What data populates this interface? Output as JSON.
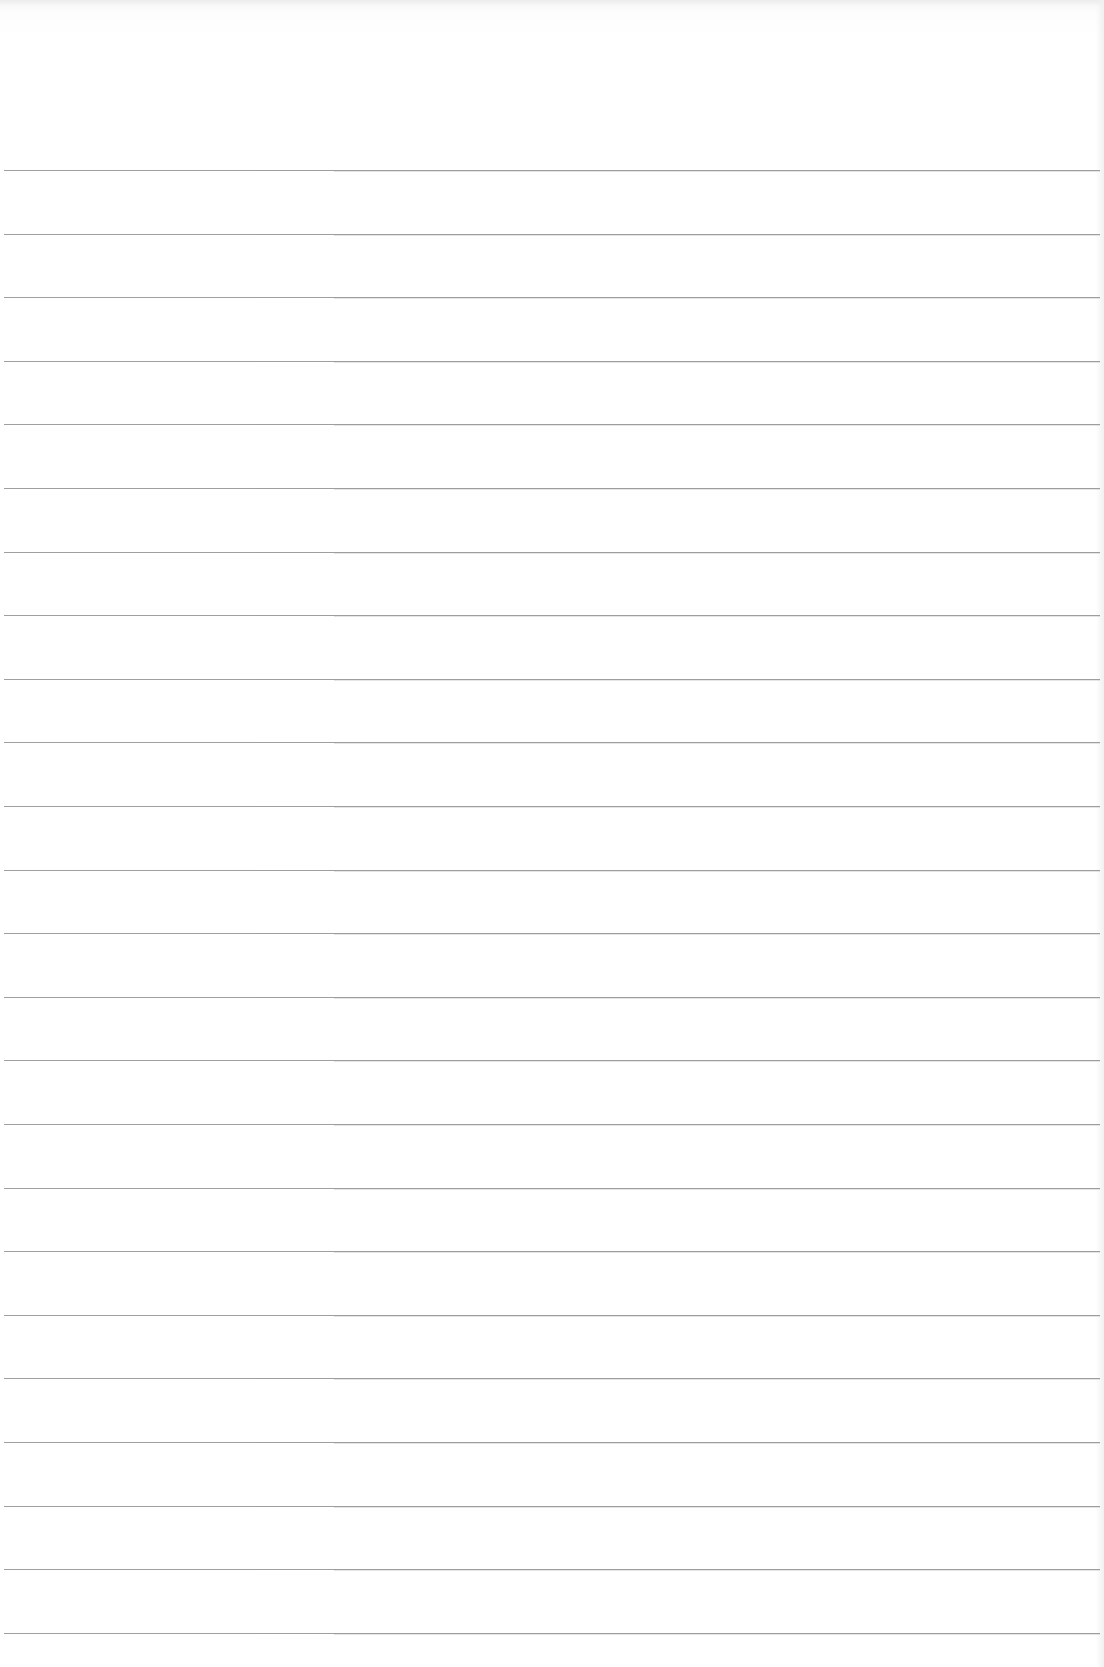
{
  "paper": {
    "type": "lined-paper",
    "background_color": "#ffffff",
    "line_color": "#8e8e8e",
    "line_count": 24,
    "first_line_y": 170,
    "line_spacing_px": 63.6,
    "line_left_x": 4,
    "line_right_x": 1100
  }
}
